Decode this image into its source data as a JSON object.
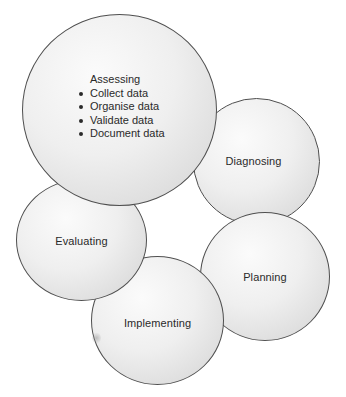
{
  "diagram": {
    "type": "cycle",
    "stages": [
      {
        "id": "assessing",
        "title": "Assessing",
        "items": [
          "Collect data",
          "Organise data",
          "Validate data",
          "Document data"
        ]
      },
      {
        "id": "diagnosing",
        "title": "Diagnosing"
      },
      {
        "id": "planning",
        "title": "Planning"
      },
      {
        "id": "implementing",
        "title": "Implementing"
      },
      {
        "id": "evaluating",
        "title": "Evaluating"
      }
    ],
    "colors": {
      "outline": "#4f4f4f",
      "fill_light": "#fbfbfb",
      "fill_dark": "#cfcfcf",
      "text": "#2a2a2a",
      "background": "#ffffff"
    }
  }
}
